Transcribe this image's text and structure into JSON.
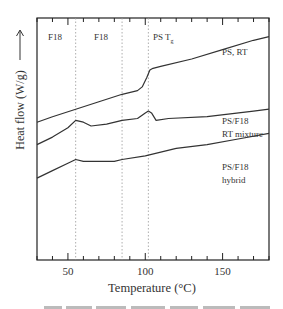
{
  "chart_data": {
    "type": "line",
    "title": "",
    "xlabel": "Temperature (°C)",
    "ylabel": "Heat flow (W/g)",
    "ylabel_arrow": "up",
    "xlim": [
      30,
      180
    ],
    "x_major_ticks": [
      50,
      100,
      150
    ],
    "x_minor_tick_step": 10,
    "y_ticks": [],
    "grid": false,
    "reference_lines": [
      {
        "x": 55,
        "label": "F18",
        "style": "dotted"
      },
      {
        "x": 85,
        "label": "F18",
        "style": "dotted"
      },
      {
        "x": 102,
        "label": "PS T",
        "label_sub": "g",
        "style": "dotted"
      }
    ],
    "series": [
      {
        "name": "PS, RT",
        "label_lines": [
          "PS, RT"
        ],
        "x": [
          30,
          40,
          55,
          70,
          85,
          95,
          98,
          101,
          103,
          105,
          110,
          130,
          150,
          170,
          180
        ],
        "y": [
          0.74,
          0.77,
          0.81,
          0.85,
          0.89,
          0.91,
          0.93,
          0.98,
          1.02,
          1.03,
          1.04,
          1.08,
          1.13,
          1.18,
          1.2
        ]
      },
      {
        "name": "PS/F18 RT mixture",
        "label_lines": [
          "PS/F18",
          "RT mixture"
        ],
        "x": [
          30,
          40,
          50,
          55,
          60,
          65,
          75,
          85,
          95,
          100,
          102,
          104,
          107,
          115,
          140,
          170,
          180
        ],
        "y": [
          0.62,
          0.66,
          0.71,
          0.75,
          0.74,
          0.72,
          0.73,
          0.75,
          0.76,
          0.79,
          0.8,
          0.79,
          0.75,
          0.76,
          0.77,
          0.8,
          0.81
        ]
      },
      {
        "name": "PS/F18 hybrid",
        "label_lines": [
          "PS/F18",
          "hybrid"
        ],
        "x": [
          30,
          40,
          50,
          55,
          60,
          70,
          80,
          85,
          100,
          120,
          140,
          160,
          180
        ],
        "y": [
          0.44,
          0.48,
          0.52,
          0.54,
          0.53,
          0.53,
          0.53,
          0.54,
          0.56,
          0.6,
          0.62,
          0.65,
          0.68
        ]
      }
    ]
  },
  "figure": {
    "caption_partial": "...curves of samples ... (PS/F18) ... hybrid ..."
  }
}
